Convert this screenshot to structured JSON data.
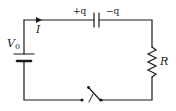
{
  "diagram": {
    "type": "circuit",
    "stroke_color": "#1a1a1a",
    "components": {
      "battery": {
        "label": "V",
        "subscript": "0"
      },
      "current": {
        "label": "I"
      },
      "capacitor": {
        "plus_label": "+q",
        "minus_label": "−q"
      },
      "resistor": {
        "label": "R"
      },
      "switch": {
        "state": "open"
      }
    }
  }
}
